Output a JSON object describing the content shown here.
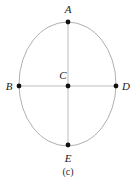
{
  "figure": {
    "caption": "(c)",
    "background_color": "#ffffff",
    "curve_color": "#9a9a9a",
    "line_color": "#b4b4b4",
    "point_color": "#111111",
    "label_color": "#1a1a1a",
    "ellipse": {
      "center_x": 67.5,
      "center_y": 84,
      "radius_x": 48.5,
      "radius_y": 62,
      "stroke_width": 0.8
    },
    "segments": [
      {
        "name": "vertical-axis-AE",
        "x1": 68,
        "y1": 22,
        "x2": 68,
        "y2": 145,
        "stroke_width": 0.9
      },
      {
        "name": "horizontal-axis-BD",
        "x1": 19,
        "y1": 86,
        "x2": 116,
        "y2": 86,
        "stroke_width": 0.9
      }
    ],
    "points": [
      {
        "id": "A",
        "label": "A",
        "x": 68,
        "y": 22,
        "radius": 2.4,
        "label_x": 68,
        "label_y": 9
      },
      {
        "id": "B",
        "label": "B",
        "x": 19,
        "y": 86,
        "radius": 2.4,
        "label_x": 9,
        "label_y": 86
      },
      {
        "id": "C",
        "label": "C",
        "x": 68,
        "y": 86,
        "radius": 2.4,
        "label_x": 63,
        "label_y": 75
      },
      {
        "id": "D",
        "label": "D",
        "x": 116,
        "y": 86,
        "radius": 2.4,
        "label_x": 126,
        "label_y": 86
      },
      {
        "id": "E",
        "label": "E",
        "x": 68,
        "y": 145,
        "radius": 2.4,
        "label_x": 68,
        "label_y": 158
      }
    ],
    "caption_x": 68,
    "caption_y": 172
  }
}
